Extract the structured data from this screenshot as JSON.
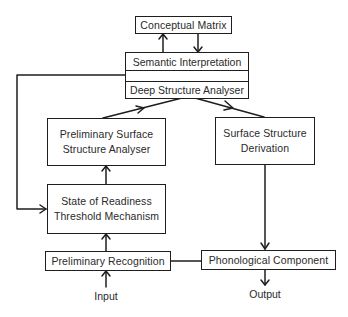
{
  "diagram": {
    "nodes": {
      "conceptual_matrix": {
        "label": "Conceptual Matrix"
      },
      "semantic_stack": {
        "top": "Semantic Interpretation",
        "middle": "",
        "bottom": "Deep Structure Analyser"
      },
      "preliminary_surface": {
        "line1": "Preliminary Surface",
        "line2": "Structure Analyser"
      },
      "surface_derivation": {
        "line1": "Surface Structure",
        "line2": "Derivation"
      },
      "state_readiness": {
        "line1": "State of Readiness",
        "line2": "Threshold Mechanism"
      },
      "preliminary_recognition": {
        "label": "Preliminary Recognition"
      },
      "phonological_component": {
        "label": "Phonological Component"
      }
    },
    "terminals": {
      "input": "Input",
      "output": "Output"
    },
    "edges": [
      {
        "from": "Semantic Interpretation",
        "to": "Conceptual Matrix"
      },
      {
        "from": "Conceptual Matrix",
        "to": "Semantic Interpretation"
      },
      {
        "from": "Preliminary Surface Structure Analyser",
        "to": "Deep Structure Analyser"
      },
      {
        "from": "Deep Structure Analyser",
        "to": "Surface Structure Derivation"
      },
      {
        "from": "Semantic Interpretation",
        "to": "State of Readiness Threshold Mechanism"
      },
      {
        "from": "State of Readiness Threshold Mechanism",
        "to": "Preliminary Surface Structure Analyser"
      },
      {
        "from": "Preliminary Recognition",
        "to": "State of Readiness Threshold Mechanism"
      },
      {
        "from": "Input",
        "to": "Preliminary Recognition"
      },
      {
        "from": "Surface Structure Derivation",
        "to": "Phonological Component"
      },
      {
        "from": "Preliminary Recognition",
        "to": "Phonological Component",
        "type": "line"
      },
      {
        "from": "Phonological Component",
        "to": "Output"
      }
    ]
  }
}
